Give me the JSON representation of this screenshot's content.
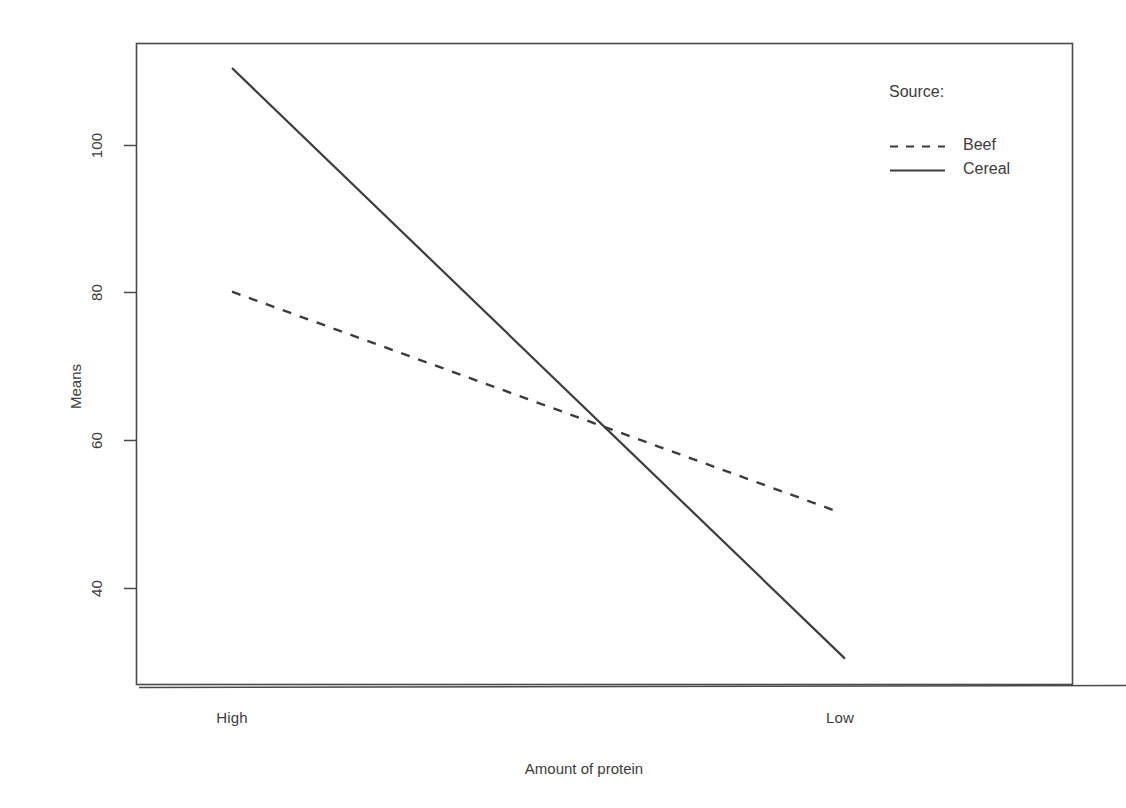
{
  "chart_data": {
    "type": "line",
    "title": "",
    "xlabel": "Amount of protein",
    "ylabel": "Means",
    "categories": [
      "High",
      "Low"
    ],
    "grid": false,
    "ylim": [
      30.5,
      110.5
    ],
    "yticks": [
      40,
      60,
      80,
      100
    ],
    "ytick_labels": [
      "40",
      "60",
      "80",
      "100"
    ],
    "xtick_labels": [
      "High",
      "Low"
    ],
    "legend": {
      "title": "Source:",
      "position": "top-right",
      "entries": [
        {
          "name": "Beef",
          "style": "dashed"
        },
        {
          "name": "Cereal",
          "style": "solid"
        }
      ]
    },
    "series": [
      {
        "name": "Beef",
        "style": "dashed",
        "color": "#3c3c3c",
        "values": [
          80.2,
          50.4
        ]
      },
      {
        "name": "Cereal",
        "style": "solid",
        "color": "#3c3c3c",
        "values": [
          110.5,
          30.5
        ]
      }
    ],
    "intersection": {
      "x_fraction": 0.6,
      "y": 61.1
    }
  },
  "axis": {
    "y_tick_0": "40",
    "y_tick_1": "60",
    "y_tick_2": "80",
    "y_tick_3": "100",
    "x_tick_0": "High",
    "x_tick_1": "Low",
    "y_title": "Means",
    "x_title": "Amount of protein"
  },
  "legend": {
    "title": "Source:",
    "item_0": "Beef",
    "item_1": "Cereal"
  },
  "colors": {
    "line": "#3c3c3c",
    "frame": "#4a4a4a",
    "text": "#3c3c3c",
    "background": "#ffffff"
  }
}
